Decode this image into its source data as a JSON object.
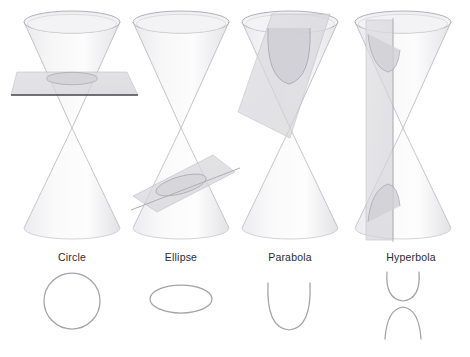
{
  "figure": {
    "background_color": "#ffffff",
    "width": 470,
    "height": 357
  },
  "style": {
    "cone_fill_light": "#f4f4f5",
    "cone_fill_mid": "#e6e6e8",
    "cone_edge": "#b9b9bd",
    "cone_rim": "#a9a9ae",
    "plane_fill": "#d8d8dc",
    "plane_edge": "#a0a0a6",
    "plane_dark_edge": "#4a4a4e",
    "curve_stroke": "#a2a2a8",
    "label_color": "#2a2a2e",
    "shadow_fill": "#ededf0"
  },
  "panels": [
    {
      "id": "circle",
      "label": "Circle",
      "label_x": 72,
      "label_y": 261,
      "plane_orientation": "horizontal",
      "plane_description": "Plane perpendicular to the cone axis, cutting the upper nappe",
      "plane_has_dark_edge": true,
      "curve": {
        "type": "circle",
        "branches": 1,
        "cx": 72,
        "cy": 301,
        "rx": 28,
        "ry": 28
      }
    },
    {
      "id": "ellipse",
      "label": "Ellipse",
      "label_x": 180,
      "label_y": 261,
      "plane_orientation": "oblique-shallow",
      "plane_description": "Plane tilted at an angle less than the slant, cutting only the lower nappe",
      "plane_has_dark_edge": false,
      "curve": {
        "type": "ellipse",
        "branches": 1,
        "cx": 181,
        "cy": 299,
        "rx": 31,
        "ry": 14
      }
    },
    {
      "id": "parabola",
      "label": "Parabola",
      "label_x": 290,
      "label_y": 261,
      "plane_orientation": "oblique-parallel-to-slant",
      "plane_description": "Plane parallel to a slant edge of the cone, cutting one nappe in an open curve",
      "plane_has_dark_edge": false,
      "curve": {
        "type": "parabola",
        "branches": 1,
        "opens": "up",
        "cx": 289,
        "top_y": 283,
        "bottom_y": 330,
        "half_width": 21
      }
    },
    {
      "id": "hyperbola",
      "label": "Hyperbola",
      "label_x": 411,
      "label_y": 261,
      "plane_orientation": "vertical",
      "plane_description": "Plane parallel to the cone axis, cutting both nappes in two branches",
      "plane_has_dark_edge": false,
      "curve": {
        "type": "hyperbola",
        "branches": 2,
        "cx": 403,
        "upper_open": "up",
        "upper_top_y": 272,
        "upper_bottom_y": 301,
        "lower_open": "down",
        "lower_top_y": 307,
        "lower_bottom_y": 339,
        "half_width": 16
      }
    }
  ],
  "cone_geometry": {
    "description": "Double cone (two nappes) viewed in perspective; upper nappe opens upward, lower nappe opens downward, joined at a central apex",
    "columns_x": [
      72,
      181,
      290,
      403
    ],
    "top_rim_y": 22,
    "apex_y": 128,
    "bottom_rim_y": 228,
    "rim_rx": 48,
    "rim_ry": 11
  }
}
